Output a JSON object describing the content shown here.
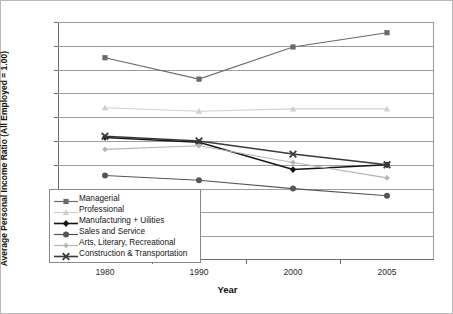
{
  "chart_data": {
    "type": "line",
    "title": "",
    "xlabel": "Year",
    "ylabel": "Average Personal Income Ratio (All Employed = 1.00)",
    "categories": [
      "1980",
      "1990",
      "2000",
      "2005"
    ],
    "ylim": [
      0.0,
      2.0
    ],
    "ytick_labels": [
      "0.0",
      "0.2",
      "0.4",
      "0.6",
      "0.8",
      "1.0",
      "1.2",
      "1.4",
      "1.6",
      "1.8",
      "2.0"
    ],
    "ytick_values": [
      0.0,
      0.2,
      0.4,
      0.6,
      0.8,
      1.0,
      1.2,
      1.4,
      1.6,
      1.8,
      2.0
    ],
    "grid": true,
    "legend_position": "lower-left-inside",
    "series": [
      {
        "name": "Managerial",
        "marker": "square",
        "color": "#6b6b6b",
        "values": [
          1.7,
          1.52,
          1.79,
          1.91
        ]
      },
      {
        "name": "Professional",
        "marker": "triangle",
        "color": "#d0d0d0",
        "values": [
          1.28,
          1.25,
          1.27,
          1.27
        ]
      },
      {
        "name": "Manufacturing + Uilities",
        "marker": "diamond",
        "color": "#141414",
        "values": [
          1.03,
          0.99,
          0.76,
          0.8
        ]
      },
      {
        "name": "Sales and Service",
        "marker": "circle",
        "color": "#565656",
        "values": [
          0.71,
          0.67,
          0.6,
          0.54
        ]
      },
      {
        "name": "Arts, Literary, Recreational",
        "marker": "small-diamond",
        "color": "#b4b4b4",
        "values": [
          0.93,
          0.96,
          0.82,
          0.69
        ]
      },
      {
        "name": "Construction & Transportation",
        "marker": "cross-x",
        "color": "#3a3a3a",
        "values": [
          1.04,
          1.0,
          0.89,
          0.8
        ]
      }
    ]
  },
  "legend": {
    "items": [
      {
        "label": "Managerial"
      },
      {
        "label": "Professional"
      },
      {
        "label": "Manufacturing + Uilities"
      },
      {
        "label": "Sales and Service"
      },
      {
        "label": "Arts, Literary, Recreational"
      },
      {
        "label": "Construction & Transportation"
      }
    ]
  }
}
